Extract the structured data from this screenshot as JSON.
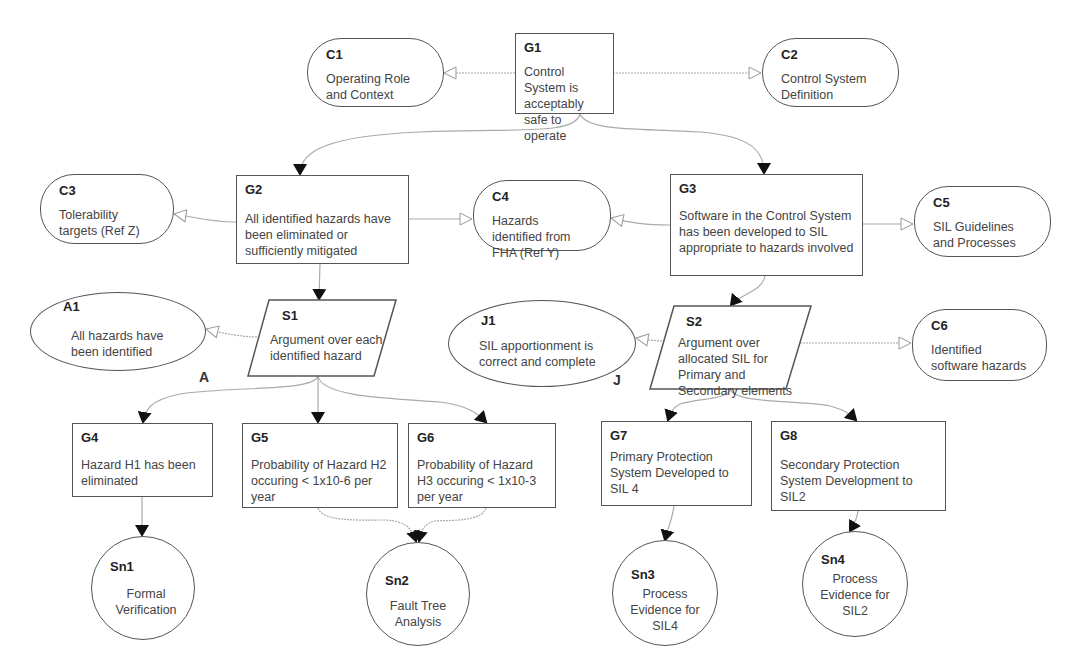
{
  "diagram": {
    "type": "GSN safety case",
    "colors": {
      "stroke": "#555555",
      "arrow_fill": "#111111",
      "context_arrow": "#ffffff",
      "text": "#444444"
    }
  },
  "nodes": {
    "G1": {
      "id": "G1",
      "kind": "goal",
      "text": "Control System is acceptably safe to operate"
    },
    "C1": {
      "id": "C1",
      "kind": "context",
      "text": "Operating Role and Context"
    },
    "C2": {
      "id": "C2",
      "kind": "context",
      "text": "Control System Definition"
    },
    "G2": {
      "id": "G2",
      "kind": "goal",
      "text": "All identified hazards have been eliminated or sufficiently mitigated"
    },
    "C3": {
      "id": "C3",
      "kind": "context",
      "text": "Tolerability targets (Ref Z)"
    },
    "C4": {
      "id": "C4",
      "kind": "context",
      "text": "Hazards identified from FHA (Ref Y)"
    },
    "G3": {
      "id": "G3",
      "kind": "goal",
      "text": "Software in the Control System has been developed to SIL appropriate to hazards involved"
    },
    "C5": {
      "id": "C5",
      "kind": "context",
      "text": "SIL Guidelines and Processes"
    },
    "A1": {
      "id": "A1",
      "kind": "assumption",
      "text": "All hazards have been identified",
      "tag": "A"
    },
    "S1": {
      "id": "S1",
      "kind": "strategy",
      "text": "Argument over each identified hazard"
    },
    "J1": {
      "id": "J1",
      "kind": "justification",
      "text": "SIL apportionment is correct and complete",
      "tag": "J"
    },
    "S2": {
      "id": "S2",
      "kind": "strategy",
      "text": "Argument over allocated SIL for Primary and Secondary elements"
    },
    "C6": {
      "id": "C6",
      "kind": "context",
      "text": "Identified software hazards"
    },
    "G4": {
      "id": "G4",
      "kind": "goal",
      "text": "Hazard H1 has been eliminated"
    },
    "G5": {
      "id": "G5",
      "kind": "goal",
      "text": "Probability of Hazard H2 occuring < 1x10-6 per year"
    },
    "G6": {
      "id": "G6",
      "kind": "goal",
      "text": "Probability of Hazard H3 occuring < 1x10-3 per year"
    },
    "G7": {
      "id": "G7",
      "kind": "goal",
      "text": "Primary Protection System Developed to SIL 4"
    },
    "G8": {
      "id": "G8",
      "kind": "goal",
      "text": "Secondary Protection System Development to SIL2"
    },
    "Sn1": {
      "id": "Sn1",
      "kind": "solution",
      "text": "Formal Verification"
    },
    "Sn2": {
      "id": "Sn2",
      "kind": "solution",
      "text": "Fault Tree Analysis"
    },
    "Sn3": {
      "id": "Sn3",
      "kind": "solution",
      "text": "Process Evidence for SIL4"
    },
    "Sn4": {
      "id": "Sn4",
      "kind": "solution",
      "text": "Process Evidence for SIL2"
    }
  },
  "edges": [
    {
      "from": "G1",
      "to": "C1",
      "type": "in-context-of"
    },
    {
      "from": "G1",
      "to": "C2",
      "type": "in-context-of"
    },
    {
      "from": "G1",
      "to": "G2",
      "type": "supported-by"
    },
    {
      "from": "G1",
      "to": "G3",
      "type": "supported-by"
    },
    {
      "from": "G2",
      "to": "C3",
      "type": "in-context-of"
    },
    {
      "from": "G2",
      "to": "C4",
      "type": "in-context-of"
    },
    {
      "from": "G3",
      "to": "C4",
      "type": "in-context-of"
    },
    {
      "from": "G3",
      "to": "C5",
      "type": "in-context-of"
    },
    {
      "from": "G2",
      "to": "S1",
      "type": "supported-by"
    },
    {
      "from": "G3",
      "to": "S2",
      "type": "supported-by"
    },
    {
      "from": "S1",
      "to": "A1",
      "type": "in-context-of"
    },
    {
      "from": "S2",
      "to": "J1",
      "type": "in-context-of"
    },
    {
      "from": "S2",
      "to": "C6",
      "type": "in-context-of"
    },
    {
      "from": "S1",
      "to": "G4",
      "type": "supported-by"
    },
    {
      "from": "S1",
      "to": "G5",
      "type": "supported-by"
    },
    {
      "from": "S1",
      "to": "G6",
      "type": "supported-by"
    },
    {
      "from": "S2",
      "to": "G7",
      "type": "supported-by"
    },
    {
      "from": "S2",
      "to": "G8",
      "type": "supported-by"
    },
    {
      "from": "G4",
      "to": "Sn1",
      "type": "supported-by"
    },
    {
      "from": "G5",
      "to": "Sn2",
      "type": "supported-by"
    },
    {
      "from": "G6",
      "to": "Sn2",
      "type": "supported-by"
    },
    {
      "from": "G7",
      "to": "Sn3",
      "type": "supported-by"
    },
    {
      "from": "G8",
      "to": "Sn4",
      "type": "supported-by"
    }
  ]
}
